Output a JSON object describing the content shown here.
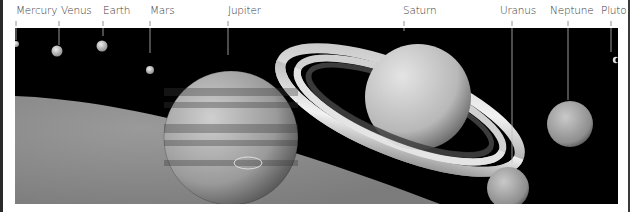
{
  "figure": {
    "background_color": "#000000",
    "page_color": "#ffffff",
    "label_color": "#3a3a3a"
  },
  "planets": [
    {
      "name": "Mercury",
      "label_x": 16,
      "label_w": 34,
      "line_x": 16,
      "line_y1": 20,
      "line_y2": 40,
      "cx": 16,
      "cy": 44,
      "r": 3,
      "fill": "#d8d8d8"
    },
    {
      "name": "Venus",
      "label_x": 62,
      "label_w": 24,
      "line_x": 59,
      "line_y1": 20,
      "line_y2": 46,
      "cx": 57,
      "cy": 51,
      "r": 5.5,
      "fill": "#c9c9c9"
    },
    {
      "name": "Earth",
      "label_x": 103,
      "label_w": 22,
      "line_x": 103,
      "line_y1": 20,
      "line_y2": 35,
      "cx": 102,
      "cy": 46,
      "r": 5.5,
      "fill": "#bdbdbd"
    },
    {
      "name": "Mars",
      "label_x": 150,
      "label_w": 22,
      "line_x": 150,
      "line_y1": 20,
      "line_y2": 52,
      "cx": 150,
      "cy": 70,
      "r": 4,
      "fill": "#b0b0b0"
    },
    {
      "name": "Jupiter",
      "label_x": 228,
      "label_w": 28,
      "line_x": 228,
      "line_y1": 20,
      "line_y2": 54,
      "cx": 231,
      "cy": 138,
      "r": 67,
      "fill": "#a8a8a8"
    },
    {
      "name": "Saturn",
      "label_x": 402,
      "label_w": 28,
      "line_x": 404,
      "line_y1": 20,
      "line_y2": 30,
      "cx": 405,
      "cy": 97,
      "r": 55,
      "fill": "#c8c8c8"
    },
    {
      "name": "Uranus",
      "label_x": 500,
      "label_w": 28,
      "line_x": 512,
      "line_y1": 20,
      "line_y2": 162,
      "cx": 508,
      "cy": 188,
      "r": 21,
      "fill": "#a9a9a9"
    },
    {
      "name": "Neptune",
      "label_x": 550,
      "label_w": 36,
      "line_x": 568,
      "line_y1": 20,
      "line_y2": 100,
      "cx": 570,
      "cy": 124,
      "r": 23,
      "fill": "#9e9e9e"
    },
    {
      "name": "Pluto",
      "label_x": 601,
      "label_w": 22,
      "line_x": 611,
      "line_y1": 20,
      "line_y2": 52,
      "cx": 615,
      "cy": 60,
      "r": 3,
      "fill": "#dcdcdc"
    }
  ],
  "sun": {
    "name": "Sun",
    "fill": "#8a8a8a"
  }
}
